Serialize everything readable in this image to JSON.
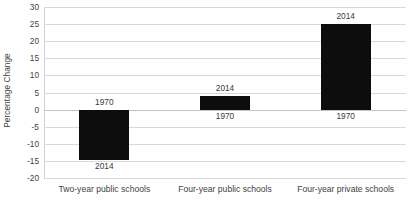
{
  "chart_data": {
    "type": "bar",
    "title": "",
    "subtitle": "",
    "xlabel": "",
    "ylabel": "Percentage Change",
    "ylim": [
      -20,
      30
    ],
    "ytick_step": 5,
    "yticks": [
      30,
      25,
      20,
      15,
      10,
      5,
      0,
      -5,
      -10,
      -15,
      -20
    ],
    "ytick_labels": [
      "30",
      "25",
      "20",
      "15",
      "10",
      "5",
      "0",
      "-5",
      "-10",
      "-15",
      "-20"
    ],
    "grid": true,
    "legend": false,
    "legend_position": "none",
    "bar_color": "#0d0d0d",
    "gridline_color": "#d9d9d9",
    "axis_color": "#d0d0d0",
    "categories": [
      "Two-year public schools",
      "Four-year public schools",
      "Four-year private schools"
    ],
    "values": [
      -14.7,
      4.0,
      25.0
    ],
    "point_labels": [
      {
        "baseline_label": "1970",
        "value_label": "2014"
      },
      {
        "baseline_label": "1970",
        "value_label": "2014"
      },
      {
        "baseline_label": "1970",
        "value_label": "2014"
      }
    ],
    "annotations": [
      {
        "text": "1970",
        "category": "Two-year public schools",
        "at_value": 0,
        "placement": "above-zero"
      },
      {
        "text": "2014",
        "category": "Two-year public schools",
        "at_value": -14.7,
        "placement": "below-bar"
      },
      {
        "text": "2014",
        "category": "Four-year public schools",
        "at_value": 4.0,
        "placement": "above-bar"
      },
      {
        "text": "1970",
        "category": "Four-year public schools",
        "at_value": 0,
        "placement": "below-zero"
      },
      {
        "text": "2014",
        "category": "Four-year private schools",
        "at_value": 25.0,
        "placement": "above-bar"
      },
      {
        "text": "1970",
        "category": "Four-year private schools",
        "at_value": 0,
        "placement": "below-zero"
      }
    ]
  }
}
